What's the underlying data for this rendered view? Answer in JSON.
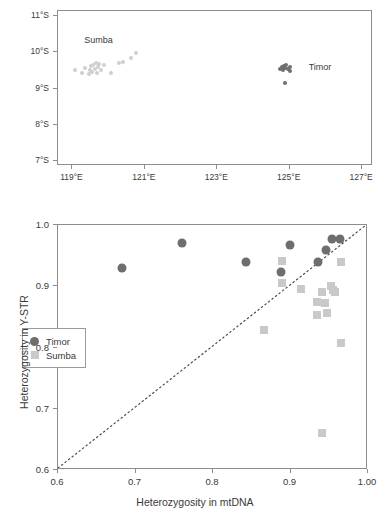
{
  "figure": {
    "panels": [
      "sampling-location-map",
      "heterozygosity-scatter"
    ]
  },
  "map": {
    "xlabel": "",
    "ylabel": "",
    "xticks": [
      "119°E",
      "121°E",
      "123°E",
      "125°E",
      "127°E"
    ],
    "xtick_values": [
      119,
      121,
      123,
      125,
      127
    ],
    "yticks": [
      "7°S",
      "8°S",
      "9°S",
      "10°S",
      "11°S"
    ],
    "ytick_values": [
      7,
      8,
      9,
      10,
      11
    ],
    "xlim": [
      118.6,
      127.3
    ],
    "ylim": [
      11.15,
      6.85
    ],
    "region_labels": [
      {
        "name": "Sumba",
        "lon": 119.35,
        "lat": 10.28
      },
      {
        "name": "Timor",
        "lon": 125.55,
        "lat": 9.55
      }
    ],
    "colors": {
      "sumba": "#cfcfcf",
      "timor": "#6f6f6f",
      "frame": "#8d8d8d"
    },
    "points": {
      "sumba": [
        [
          119.08,
          9.51
        ],
        [
          119.25,
          9.44
        ],
        [
          119.34,
          9.58
        ],
        [
          119.45,
          9.39
        ],
        [
          119.48,
          9.52
        ],
        [
          119.52,
          9.62
        ],
        [
          119.55,
          9.46
        ],
        [
          119.58,
          9.66
        ],
        [
          119.62,
          9.55
        ],
        [
          119.64,
          9.7
        ],
        [
          119.68,
          9.44
        ],
        [
          119.7,
          9.6
        ],
        [
          119.74,
          9.67
        ],
        [
          119.8,
          9.5
        ],
        [
          119.88,
          9.64
        ],
        [
          120.05,
          9.42
        ],
        [
          120.28,
          9.7
        ],
        [
          120.4,
          9.74
        ],
        [
          120.62,
          9.84
        ],
        [
          120.75,
          9.98
        ]
      ],
      "timor": [
        [
          124.72,
          9.55
        ],
        [
          124.78,
          9.6
        ],
        [
          124.82,
          9.52
        ],
        [
          124.84,
          9.62
        ],
        [
          124.88,
          9.57
        ],
        [
          124.9,
          9.65
        ],
        [
          124.95,
          9.54
        ],
        [
          125.0,
          9.48
        ],
        [
          125.02,
          9.61
        ],
        [
          124.86,
          9.15
        ]
      ]
    }
  },
  "scatter": {
    "xtitle": "Heterozygosity in mtDNA",
    "ytitle": "Heterozygosity in Y-STR",
    "xticks": [
      "0.6",
      "0.7",
      "0.8",
      "0.9",
      "1.00"
    ],
    "yticks": [
      "0.6",
      "0.7",
      "0.8",
      "0.9",
      "1.0"
    ],
    "legend": [
      {
        "label": "Timor",
        "marker": "circle",
        "color": "#6e6e6e"
      },
      {
        "label": "Sumba",
        "marker": "square",
        "color": "#c9c9c9"
      }
    ]
  },
  "chart_data": {
    "type": "scatter",
    "title": "",
    "xlabel": "Heterozygosity in mtDNA",
    "ylabel": "Heterozygosity in Y-STR",
    "xlim": [
      0.6,
      1.0
    ],
    "ylim": [
      0.6,
      1.0
    ],
    "xticks": [
      0.6,
      0.7,
      0.8,
      0.9,
      1.0
    ],
    "xticklabels": [
      "0.6",
      "0.7",
      "0.8",
      "0.9",
      "1.00"
    ],
    "yticks": [
      0.6,
      0.7,
      0.8,
      0.9,
      1.0
    ],
    "yticklabels": [
      "0.6",
      "0.7",
      "0.8",
      "0.9",
      "1.0"
    ],
    "grid": false,
    "legend_position": "center-left",
    "annotations": [
      {
        "type": "line",
        "style": "dotted",
        "label": "identity line y = x",
        "from": [
          0.6,
          0.6
        ],
        "to": [
          1.0,
          1.0
        ]
      }
    ],
    "series": [
      {
        "name": "Timor",
        "marker": "circle",
        "color": "#6e6e6e",
        "points": [
          [
            0.683,
            0.93
          ],
          [
            0.76,
            0.97
          ],
          [
            0.842,
            0.94
          ],
          [
            0.888,
            0.923
          ],
          [
            0.899,
            0.967
          ],
          [
            0.936,
            0.94
          ],
          [
            0.946,
            0.959
          ],
          [
            0.954,
            0.977
          ],
          [
            0.964,
            0.977
          ]
        ]
      },
      {
        "name": "Sumba",
        "marker": "square",
        "color": "#c9c9c9",
        "points": [
          [
            0.866,
            0.828
          ],
          [
            0.889,
            0.941
          ],
          [
            0.889,
            0.906
          ],
          [
            0.913,
            0.896
          ],
          [
            0.934,
            0.874
          ],
          [
            0.934,
            0.853
          ],
          [
            0.94,
            0.89
          ],
          [
            0.944,
            0.873
          ],
          [
            0.947,
            0.856
          ],
          [
            0.952,
            0.901
          ],
          [
            0.955,
            0.894
          ],
          [
            0.957,
            0.89
          ],
          [
            0.965,
            0.939
          ],
          [
            0.965,
            0.807
          ],
          [
            0.94,
            0.661
          ]
        ]
      }
    ]
  }
}
